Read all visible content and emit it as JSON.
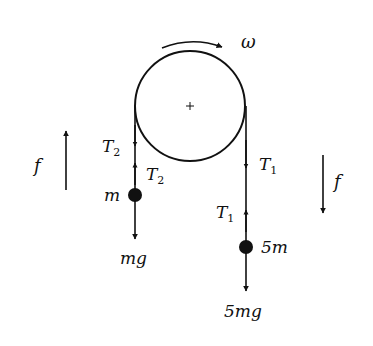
{
  "diagram": {
    "type": "pulley-free-body",
    "pulley": {
      "label": "pulley",
      "rotation_label": "ω",
      "rotation_direction": "clockwise"
    },
    "left_side": {
      "mass_label": "m",
      "tension_label": "T",
      "tension_sub": "2",
      "tension_label_upper": "T",
      "tension_sub_upper": "2",
      "weight_label": "mg",
      "friction_label": "f",
      "friction_direction": "up"
    },
    "right_side": {
      "mass_label": "5m",
      "tension_label": "T",
      "tension_sub": "1",
      "tension_label_lower": "T",
      "tension_sub_lower": "1",
      "weight_label": "5mg",
      "friction_label": "f",
      "friction_direction": "down"
    },
    "colors": {
      "ink": "#111111",
      "background": "#ffffff"
    }
  }
}
